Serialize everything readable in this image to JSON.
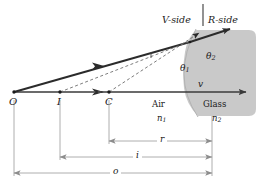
{
  "figure": {
    "colors": {
      "glass_fill": "#c9c9c9",
      "ray": "#2b2b2b",
      "dashed": "#6e6e6e",
      "axis": "#3a3a3a",
      "dimension": "#9a9a9a",
      "text": "#1a1a1a"
    },
    "side_labels": {
      "v_side": "V-side",
      "r_side": "R-side"
    },
    "media": {
      "left_name": "Air",
      "left_index": "n",
      "left_index_sub": "1",
      "right_name": "Glass",
      "right_index": "n",
      "right_index_sub": "2"
    },
    "angles": {
      "theta1": "θ",
      "theta1_sub": "1",
      "theta2": "θ",
      "theta2_sub": "2"
    },
    "axis_label": "v",
    "points": [
      {
        "id": "O",
        "label": "O",
        "x": 14,
        "y": 96
      },
      {
        "id": "I",
        "label": "I",
        "x": 60,
        "y": 96
      },
      {
        "id": "C",
        "label": "C",
        "x": 109,
        "y": 96
      }
    ],
    "dimensions": [
      {
        "id": "r",
        "label": "r",
        "from": "C",
        "to": "vertex"
      },
      {
        "id": "i",
        "label": "i",
        "from": "I",
        "to": "vertex"
      },
      {
        "id": "o",
        "label": "o",
        "from": "O",
        "to": "vertex"
      }
    ]
  }
}
